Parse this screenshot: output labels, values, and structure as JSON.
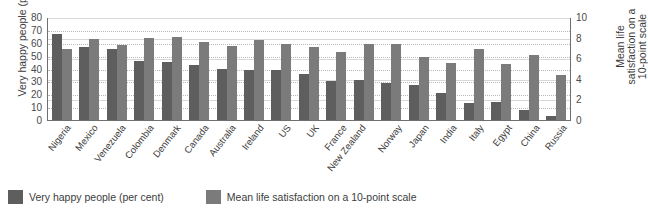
{
  "chart_data": {
    "type": "bar",
    "title": "",
    "subtitle": "",
    "xlabel": "",
    "ylabel": "Very happy people (per cent)",
    "y2label": "Mean life satisfaction on a 10-point scale",
    "ylim": [
      0,
      80
    ],
    "y2lim": [
      0,
      10
    ],
    "yticks": [
      0,
      10,
      20,
      30,
      40,
      50,
      60,
      70,
      80
    ],
    "y2ticks": [
      0,
      2,
      4,
      6,
      8,
      10
    ],
    "grid": true,
    "legend_position": "bottom-left",
    "categories": [
      "Nigeria",
      "Mexico",
      "Venezuela",
      "Colombia",
      "Denmark",
      "Canada",
      "Australia",
      "Ireland",
      "US",
      "UK",
      "France",
      "New Zealand",
      "Norway",
      "Japan",
      "India",
      "Italy",
      "Egypt",
      "China",
      "Russia"
    ],
    "series": [
      {
        "name": "Very happy people (per cent)",
        "axis": "left",
        "color": "#5e5e5e",
        "values": [
          67,
          57,
          55,
          46,
          45,
          43,
          40,
          39,
          39,
          36,
          30,
          31,
          29,
          27,
          21,
          13,
          14,
          8,
          3
        ]
      },
      {
        "name": "Mean life satisfaction on a 10-point scale",
        "axis": "right",
        "color": "#7b7b7b",
        "values": [
          6.9,
          7.9,
          7.3,
          8.0,
          8.1,
          7.6,
          7.2,
          7.8,
          7.4,
          7.1,
          6.6,
          7.4,
          7.4,
          6.1,
          5.5,
          6.9,
          5.4,
          6.3,
          4.4
        ]
      }
    ]
  },
  "legend": {
    "items": [
      {
        "label": "Very happy people (per cent)",
        "color": "#5e5e5e"
      },
      {
        "label": "Mean life satisfaction on a 10-point scale",
        "color": "#7b7b7b"
      }
    ]
  }
}
